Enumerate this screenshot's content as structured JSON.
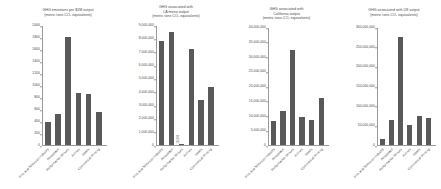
{
  "figure": {
    "background": "#ffffff",
    "bar_color": "#595959",
    "axis_color": "#9a9a9a",
    "text_color": "#4a4a4a",
    "panel_count": 4
  },
  "categories": [
    "Film and Television Industry",
    "Aerospace",
    "Performance Venues",
    "Airlines",
    "Hotels",
    "Commercial Printing"
  ],
  "chart_data": [
    {
      "type": "bar",
      "title": "GHG emissions per $1M output\n(metric tons CO₂ equivalents)",
      "xlabel": "",
      "ylabel": "",
      "ylim": [
        0,
        2000
      ],
      "yticks": [
        0,
        200,
        400,
        600,
        800,
        1000,
        1200,
        1400,
        1600,
        1800,
        2000
      ],
      "ytick_labels": [
        "0",
        "200",
        "400",
        "600",
        "800",
        "1000",
        "1200",
        "1400",
        "1600",
        "1800",
        "2000"
      ],
      "grid": false,
      "legend": "none",
      "categories": [
        "Film and Television Industry",
        "Aerospace",
        "Performance Venues",
        "Airlines",
        "Hotels",
        "Commercial Printing"
      ],
      "values": [
        395,
        525,
        1810,
        880,
        860,
        560
      ]
    },
    {
      "type": "bar",
      "title": "GHG associated with\nLA metro output\n(metric tons CO₂ equivalents)",
      "xlabel": "",
      "ylabel": "",
      "ylim": [
        0,
        9000000
      ],
      "yticks": [
        0,
        1000000,
        2000000,
        3000000,
        4000000,
        5000000,
        6000000,
        7000000,
        8000000,
        9000000
      ],
      "ytick_labels": [
        "0",
        "1,000,000",
        "2,000,000",
        "3,000,000",
        "4,000,000",
        "5,000,000",
        "6,000,000",
        "7,000,000",
        "8,000,000",
        "9,000,000"
      ],
      "grid": false,
      "legend": "none",
      "categories": [
        "Film and Television Industry",
        "Aerospace",
        "Performance Venues",
        "Airlines",
        "Hotels",
        "Commercial Printing"
      ],
      "values": [
        7900000,
        8550000,
        140000,
        7300000,
        3400000,
        4400000
      ],
      "annotations": [
        {
          "category": "Performance Venues",
          "text": "130,000"
        }
      ]
    },
    {
      "type": "bar",
      "title": "GHG associated with\nCalifornia output\n(metric tons CO₂ equivalents)",
      "xlabel": "",
      "ylabel": "",
      "ylim": [
        0,
        40000000
      ],
      "yticks": [
        0,
        5000000,
        10000000,
        15000000,
        20000000,
        25000000,
        30000000,
        35000000,
        40000000
      ],
      "ytick_labels": [
        "0",
        "5,000,000",
        "10,000,000",
        "15,000,000",
        "20,000,000",
        "25,000,000",
        "30,000,000",
        "35,000,000",
        "40,000,000"
      ],
      "grid": false,
      "legend": "none",
      "categories": [
        "Film and Television Industry",
        "Aerospace",
        "Performance Venues",
        "Airlines",
        "Hotels",
        "Commercial Printing"
      ],
      "values": [
        8300000,
        11800000,
        32500000,
        9800000,
        8500000,
        16200000
      ]
    },
    {
      "type": "bar",
      "title": "GHG associated with US output\n(metric tons CO₂ equivalents)",
      "xlabel": "",
      "ylabel": "",
      "ylim": [
        0,
        300000000
      ],
      "yticks": [
        0,
        50000000,
        100000000,
        150000000,
        200000000,
        250000000,
        300000000
      ],
      "ytick_labels": [
        "0",
        "50,000,000",
        "100,000,000",
        "150,000,000",
        "200,000,000",
        "250,000,000",
        "300,000,000"
      ],
      "grid": false,
      "legend": "none",
      "categories": [
        "Film and Television Industry",
        "Aerospace",
        "Performance Venues",
        "Airlines",
        "Hotels",
        "Commercial Printing"
      ],
      "values": [
        16000000,
        64000000,
        277000000,
        53000000,
        76000000,
        70000000
      ]
    }
  ]
}
